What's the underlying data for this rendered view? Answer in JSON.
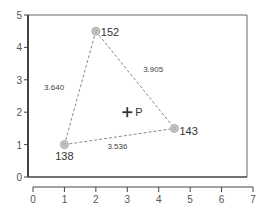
{
  "chart_data": {
    "type": "scatter",
    "title": "",
    "xlabel": "",
    "ylabel": "",
    "xlim": [
      0,
      7
    ],
    "ylim": [
      0,
      5
    ],
    "grid": false,
    "legend": null,
    "x_ticks": [
      "0",
      "1",
      "2",
      "3",
      "4",
      "5",
      "6",
      "7"
    ],
    "y_ticks": [
      "0",
      "1",
      "2",
      "3",
      "4",
      "5"
    ],
    "points": [
      {
        "id": "152",
        "x": 2.0,
        "y": 4.5
      },
      {
        "id": "143",
        "x": 4.5,
        "y": 1.5
      },
      {
        "id": "138",
        "x": 1.0,
        "y": 1.0
      }
    ],
    "edges": [
      {
        "from": "152",
        "to": "138",
        "length": "3.640"
      },
      {
        "from": "152",
        "to": "143",
        "length": "3.905"
      },
      {
        "from": "138",
        "to": "143",
        "length": "3.536"
      }
    ],
    "marker": {
      "label": "P",
      "x": 3.0,
      "y": 2.0,
      "symbol": "+"
    },
    "colors": {
      "axis": "#444444",
      "edge": "#888888",
      "point_fill": "#cccccc",
      "text": "#333333"
    }
  }
}
